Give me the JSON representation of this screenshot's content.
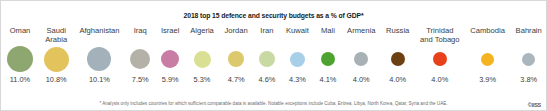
{
  "title": "2018 top 15 defence and security budgets as a % of GDP*",
  "footnote": "* Analysis only includes countries for which sufficient comparable data is available. Notable exceptions include Cuba, Eritrea, Libya, North Korea, Qatar, Syria and the UAE.",
  "credit": "©IISS",
  "chart_data": {
    "type": "bar",
    "title": "2018 top 15 defence and security budgets as a % of GDP*",
    "xlabel": "",
    "ylabel": "Defence and security budget as a % of GDP",
    "categories": [
      "Oman",
      "Saudi Arabia",
      "Afghanistan",
      "Iraq",
      "Israel",
      "Algeria",
      "Jordan",
      "Iran",
      "Kuwait",
      "Mali",
      "Armenia",
      "Russia",
      "Trinidad and Tobago",
      "Cambodia",
      "Bahrain"
    ],
    "values": [
      11.0,
      10.8,
      10.1,
      7.5,
      5.9,
      5.3,
      4.7,
      4.6,
      4.3,
      4.1,
      4.0,
      4.0,
      4.0,
      3.9,
      3.8
    ],
    "value_labels": [
      "11.0%",
      "10.8%",
      "10.1%",
      "7.5%",
      "5.9%",
      "5.3%",
      "4.7%",
      "4.6%",
      "4.3%",
      "4.1%",
      "4.0%",
      "4.0%",
      "4.0%",
      "3.9%",
      "3.8%"
    ],
    "colors": [
      "#8ea670",
      "#e3c45c",
      "#a3b1bb",
      "#b4b2a8",
      "#c97da5",
      "#d9e093",
      "#ddc96d",
      "#c8d9a4",
      "#a8cfe8",
      "#4da32f",
      "#a8b1b6",
      "#6d4012",
      "#e8401a",
      "#f6b320",
      "#a9b6bd"
    ],
    "bubble_diameters": [
      26,
      25,
      24,
      20,
      18,
      17,
      16,
      16,
      15,
      14,
      14,
      14,
      14,
      13,
      13
    ],
    "legend": "none",
    "grid": false,
    "units": "percent of GDP"
  }
}
